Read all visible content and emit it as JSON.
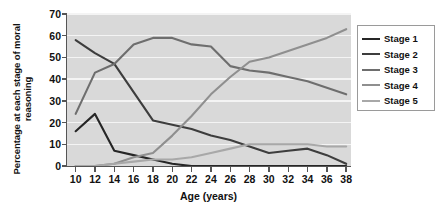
{
  "chart_data": {
    "type": "line",
    "title": "",
    "xlabel": "Age (years)",
    "ylabel": "Percentage at each stage of moral reasoning",
    "xlim": [
      9,
      38.5
    ],
    "ylim": [
      0,
      70
    ],
    "xticks": [
      10,
      12,
      14,
      16,
      18,
      20,
      22,
      24,
      26,
      28,
      30,
      32,
      34,
      36,
      38
    ],
    "yticks": [
      0,
      10,
      20,
      30,
      40,
      50,
      60,
      70
    ],
    "grid": "horizontal",
    "legend_position": "right",
    "plot_background": "#d9d9d9",
    "gridline_color": "#f4f4f4",
    "x": [
      10,
      12,
      14,
      16,
      18,
      20,
      22,
      24,
      26,
      28,
      30,
      32,
      34,
      36,
      38
    ],
    "series": [
      {
        "name": "Stage 1",
        "color": "#262626",
        "values": [
          16,
          24,
          7,
          5,
          3,
          1,
          0,
          0,
          0,
          0,
          0,
          0,
          0,
          0,
          0
        ]
      },
      {
        "name": "Stage 2",
        "color": "#3d3d3d",
        "values": [
          58,
          52,
          47,
          34,
          21,
          19,
          17,
          14,
          12,
          9,
          6,
          7,
          8,
          5,
          1
        ]
      },
      {
        "name": "Stage 3",
        "color": "#6e6e6e",
        "values": [
          24,
          43,
          47,
          56,
          59,
          59,
          56,
          55,
          46,
          44,
          43,
          41,
          39,
          36,
          33
        ]
      },
      {
        "name": "Stage 4",
        "color": "#8f8f8f",
        "values": [
          0,
          0,
          1,
          4,
          6,
          14,
          23,
          33,
          41,
          48,
          50,
          53,
          56,
          59,
          63
        ]
      },
      {
        "name": "Stage 5",
        "color": "#a8a8a8",
        "values": [
          0,
          0,
          1,
          2,
          3,
          3,
          4,
          6,
          8,
          10,
          10,
          10,
          10,
          9,
          9
        ]
      }
    ]
  },
  "legend": {
    "items": [
      {
        "label": "Stage 1"
      },
      {
        "label": "Stage 2"
      },
      {
        "label": "Stage 3"
      },
      {
        "label": "Stage 4"
      },
      {
        "label": "Stage 5"
      }
    ]
  }
}
